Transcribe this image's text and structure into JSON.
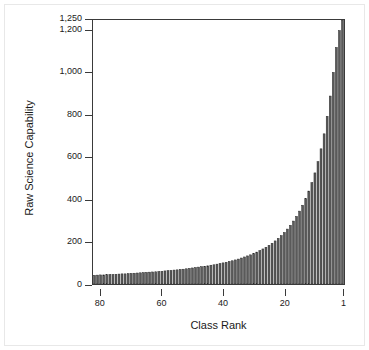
{
  "chart_data": {
    "type": "bar",
    "title": "",
    "subtitle": "",
    "xlabel": "Class Rank",
    "ylabel": "Raw Science Capability",
    "grid": false,
    "legend": null,
    "x_axis_reversed": true,
    "xlim": [
      82,
      1
    ],
    "ylim": [
      0,
      1250
    ],
    "yticks": [
      0,
      200,
      400,
      600,
      800,
      1000,
      1200,
      1250
    ],
    "ytick_labels": [
      "0",
      "200",
      "400",
      "600",
      "800",
      "1,000",
      "1,200",
      "1,250"
    ],
    "xticks": [
      80,
      60,
      40,
      20,
      1
    ],
    "xtick_labels": [
      "80",
      "60",
      "40",
      "20",
      "1"
    ],
    "categories": [
      82,
      81,
      80,
      79,
      78,
      77,
      76,
      75,
      74,
      73,
      72,
      71,
      70,
      69,
      68,
      67,
      66,
      65,
      64,
      63,
      62,
      61,
      60,
      59,
      58,
      57,
      56,
      55,
      54,
      53,
      52,
      51,
      50,
      49,
      48,
      47,
      46,
      45,
      44,
      43,
      42,
      41,
      40,
      39,
      38,
      37,
      36,
      35,
      34,
      33,
      32,
      31,
      30,
      29,
      28,
      27,
      26,
      25,
      24,
      23,
      22,
      21,
      20,
      19,
      18,
      17,
      16,
      15,
      14,
      13,
      12,
      11,
      10,
      9,
      8,
      7,
      6,
      5,
      4,
      3,
      2,
      1
    ],
    "values": [
      41,
      42,
      43,
      43,
      44,
      45,
      45,
      46,
      47,
      48,
      48,
      49,
      50,
      51,
      52,
      53,
      54,
      55,
      56,
      57,
      58,
      59,
      60,
      62,
      63,
      64,
      66,
      67,
      69,
      70,
      72,
      74,
      76,
      78,
      80,
      82,
      84,
      86,
      89,
      91,
      94,
      97,
      100,
      103,
      107,
      110,
      114,
      118,
      123,
      128,
      133,
      138,
      144,
      151,
      158,
      166,
      174,
      183,
      193,
      204,
      216,
      229,
      244,
      260,
      278,
      298,
      320,
      345,
      373,
      404,
      440,
      480,
      526,
      579,
      640,
      711,
      794,
      890,
      1002,
      1120,
      1200,
      1250
    ],
    "bar_color": "#5a5a5a",
    "bar_edge_color": "#2a2a2a",
    "axis_color": "#3a3a3a",
    "background_color": "#ffffff"
  }
}
